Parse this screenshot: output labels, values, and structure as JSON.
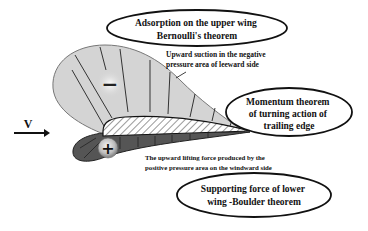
{
  "diagram": {
    "type": "airfoil-pressure-distribution",
    "velocity_label": "V",
    "upper_sign": "−",
    "lower_sign": "+",
    "callouts": {
      "upper": {
        "line1": "Adsorption on the upper wing",
        "line2": "Bernoulli's theorem"
      },
      "trailing": {
        "line1": "Momentum theorem",
        "line2": "of turning action of",
        "line3": "trailing edge"
      },
      "lower": {
        "line1": "Supporting force of lower",
        "line2": "wing -Boulder theorem"
      }
    },
    "annotations": {
      "suction": {
        "line1": "Upward suction in the negative",
        "line2": "pressure area of leeward side"
      },
      "lifting": {
        "line1": "The upward lifting force produced by the",
        "line2": "positive pressure area on the windward side"
      }
    },
    "colors": {
      "suction_region": "#d4d4d4",
      "pressure_region": "#555555",
      "outline": "#111111",
      "background": "#ffffff"
    }
  }
}
